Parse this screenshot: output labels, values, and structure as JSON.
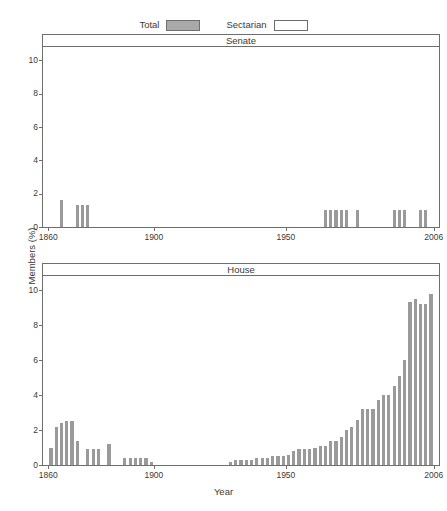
{
  "legend": {
    "entries": [
      {
        "label": "Total",
        "style": "filled",
        "color": "#a9a9a9"
      },
      {
        "label": "Sectarian",
        "style": "empty",
        "color": "#ffffff"
      }
    ]
  },
  "axis": {
    "ylabel": "Members (%)",
    "xlabel": "Year",
    "xticks": [
      "1860",
      "1900",
      "1950",
      "2006"
    ],
    "xtick_values": [
      1860,
      1900,
      1950,
      2006
    ],
    "yticks": [
      "0",
      "2",
      "4",
      "6",
      "8",
      "10"
    ],
    "ytick_values": [
      0,
      2,
      4,
      6,
      8,
      10
    ]
  },
  "panels": [
    {
      "title": "Senate"
    },
    {
      "title": "House"
    }
  ],
  "chart_data": [
    {
      "type": "bar",
      "title": "Senate",
      "xlabel": "Year",
      "ylabel": "Members (%)",
      "xlim": [
        1858,
        2008
      ],
      "ylim": [
        0,
        10.8
      ],
      "grid": false,
      "legend_position": "top-center",
      "series": [
        {
          "name": "Total",
          "color": "#9a9a9a",
          "x": [
            1865,
            1871,
            1873,
            1875,
            1965,
            1967,
            1969,
            1971,
            1973,
            1977,
            1991,
            1993,
            1995,
            2001,
            2003
          ],
          "values": [
            1.6,
            1.3,
            1.3,
            1.3,
            1.0,
            1.0,
            1.0,
            1.0,
            1.0,
            1.0,
            1.0,
            1.0,
            1.0,
            1.0,
            1.0
          ]
        },
        {
          "name": "Sectarian",
          "color": "#ffffff",
          "x": [],
          "values": []
        }
      ]
    },
    {
      "type": "bar",
      "title": "House",
      "xlabel": "Year",
      "ylabel": "Members (%)",
      "xlim": [
        1858,
        2008
      ],
      "ylim": [
        0,
        10.8
      ],
      "grid": false,
      "legend_position": "top-center",
      "series": [
        {
          "name": "Total",
          "color": "#9a9a9a",
          "x": [
            1861,
            1863,
            1865,
            1867,
            1869,
            1871,
            1875,
            1877,
            1879,
            1883,
            1889,
            1891,
            1893,
            1895,
            1897,
            1899,
            1929,
            1931,
            1933,
            1935,
            1937,
            1939,
            1941,
            1943,
            1945,
            1947,
            1949,
            1951,
            1953,
            1955,
            1957,
            1959,
            1961,
            1963,
            1965,
            1967,
            1969,
            1971,
            1973,
            1975,
            1977,
            1979,
            1981,
            1983,
            1985,
            1987,
            1989,
            1991,
            1993,
            1995,
            1997,
            1999,
            2001,
            2003,
            2005
          ],
          "values": [
            1.0,
            2.2,
            2.4,
            2.5,
            2.5,
            1.4,
            0.9,
            0.9,
            0.9,
            1.2,
            0.4,
            0.4,
            0.4,
            0.4,
            0.4,
            0.2,
            0.2,
            0.3,
            0.3,
            0.3,
            0.3,
            0.4,
            0.4,
            0.4,
            0.5,
            0.5,
            0.5,
            0.6,
            0.8,
            0.9,
            0.9,
            0.9,
            1.0,
            1.1,
            1.1,
            1.4,
            1.4,
            1.6,
            2.0,
            2.2,
            2.6,
            3.2,
            3.2,
            3.2,
            3.7,
            4.0,
            4.0,
            4.5,
            5.1,
            6.0,
            9.3,
            9.5,
            9.2,
            9.2,
            9.8
          ]
        },
        {
          "name": "Sectarian",
          "color": "#ffffff",
          "x": [],
          "values": []
        }
      ]
    }
  ]
}
